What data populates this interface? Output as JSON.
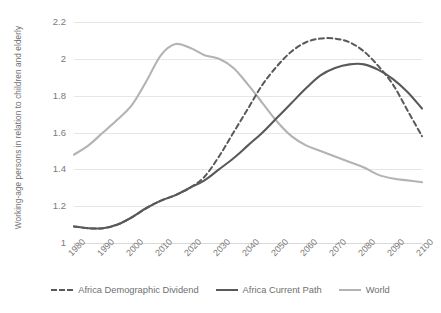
{
  "chart_data": {
    "type": "line",
    "title": "",
    "xlabel": "",
    "ylabel": "Working-age persons in relation to children and elderly",
    "xlim": [
      1980,
      2100
    ],
    "ylim": [
      1,
      2.2
    ],
    "ytick_labels": [
      "1",
      "1.2",
      "1.4",
      "1.6",
      "1.8",
      "2",
      "2.2"
    ],
    "ytick_values": [
      1,
      1.2,
      1.4,
      1.6,
      1.8,
      2,
      2.2
    ],
    "xtick_labels": [
      "1980",
      "1990",
      "2000",
      "2010",
      "2020",
      "2030",
      "2040",
      "2050",
      "2060",
      "2070",
      "2080",
      "2090",
      "2100"
    ],
    "xtick_values": [
      1980,
      1990,
      2000,
      2010,
      2020,
      2030,
      2040,
      2050,
      2060,
      2070,
      2080,
      2090,
      2100
    ],
    "grid": true,
    "legend_position": "bottom",
    "x": [
      1980,
      1985,
      1990,
      1995,
      2000,
      2005,
      2010,
      2015,
      2020,
      2025,
      2030,
      2035,
      2040,
      2045,
      2050,
      2055,
      2060,
      2065,
      2070,
      2075,
      2080,
      2085,
      2090,
      2095,
      2100
    ],
    "series": [
      {
        "name": "Africa Demographic Dividend",
        "color": "#595959",
        "style": "dashed",
        "values": [
          1.09,
          1.08,
          1.08,
          1.1,
          1.14,
          1.19,
          1.23,
          1.26,
          1.3,
          1.36,
          1.47,
          1.6,
          1.73,
          1.86,
          1.96,
          2.04,
          2.09,
          2.11,
          2.11,
          2.09,
          2.04,
          1.96,
          1.86,
          1.72,
          1.58
        ]
      },
      {
        "name": "Africa Current Path",
        "color": "#595959",
        "style": "solid",
        "values": [
          1.09,
          1.08,
          1.08,
          1.1,
          1.14,
          1.19,
          1.23,
          1.26,
          1.3,
          1.34,
          1.4,
          1.46,
          1.53,
          1.6,
          1.68,
          1.76,
          1.84,
          1.91,
          1.95,
          1.97,
          1.97,
          1.94,
          1.89,
          1.82,
          1.73
        ]
      },
      {
        "name": "World",
        "color": "#b3b3b3",
        "style": "solid",
        "values": [
          1.48,
          1.53,
          1.6,
          1.67,
          1.75,
          1.88,
          2.02,
          2.08,
          2.06,
          2.02,
          2.0,
          1.95,
          1.86,
          1.76,
          1.66,
          1.58,
          1.53,
          1.5,
          1.47,
          1.44,
          1.41,
          1.37,
          1.35,
          1.34,
          1.33
        ]
      }
    ]
  },
  "legend": {
    "items": [
      {
        "label": "Africa Demographic Dividend"
      },
      {
        "label": "Africa Current Path"
      },
      {
        "label": "World"
      }
    ]
  }
}
